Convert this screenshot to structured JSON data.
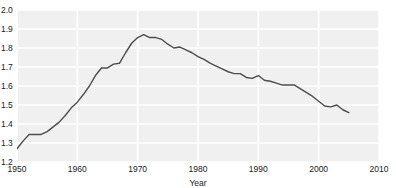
{
  "chart_data": {
    "type": "line",
    "title": "",
    "subtitle": "",
    "xlabel": "Year",
    "ylabel": "",
    "xlim": [
      1950,
      2010
    ],
    "ylim": [
      1.2,
      2.0
    ],
    "grid": true,
    "legend": false,
    "legend_position": "none",
    "line_color": "#4d4d4d",
    "plot_background": "#f0f0f0",
    "gridline_color": "#ffffff",
    "xticks": [
      "1950",
      "1960",
      "1970",
      "1980",
      "1990",
      "2000",
      "2010"
    ],
    "xtick_values": [
      1950,
      1960,
      1970,
      1980,
      1990,
      2000,
      2010
    ],
    "yticks": [
      "1.2",
      "1.3",
      "1.4",
      "1.5",
      "1.6",
      "1.7",
      "1.8",
      "1.9",
      "2.0"
    ],
    "ytick_values": [
      1.2,
      1.3,
      1.4,
      1.5,
      1.6,
      1.7,
      1.8,
      1.9,
      2.0
    ],
    "series": [
      {
        "name": "",
        "x": [
          1950,
          1951,
          1952,
          1953,
          1954,
          1955,
          1956,
          1957,
          1958,
          1959,
          1960,
          1961,
          1962,
          1963,
          1964,
          1965,
          1966,
          1967,
          1968,
          1969,
          1970,
          1971,
          1972,
          1973,
          1974,
          1975,
          1976,
          1977,
          1978,
          1979,
          1980,
          1981,
          1982,
          1983,
          1984,
          1985,
          1986,
          1987,
          1988,
          1989,
          1990,
          1991,
          1992,
          1993,
          1994,
          1995,
          1996,
          1997,
          1998,
          1999,
          2000,
          2001,
          2002,
          2003,
          2004,
          2005
        ],
        "values": [
          1.27,
          1.31,
          1.345,
          1.345,
          1.345,
          1.36,
          1.385,
          1.41,
          1.445,
          1.485,
          1.515,
          1.555,
          1.6,
          1.655,
          1.695,
          1.695,
          1.715,
          1.72,
          1.775,
          1.825,
          1.855,
          1.87,
          1.855,
          1.855,
          1.845,
          1.82,
          1.8,
          1.805,
          1.79,
          1.775,
          1.755,
          1.74,
          1.72,
          1.705,
          1.69,
          1.675,
          1.665,
          1.665,
          1.645,
          1.64,
          1.655,
          1.63,
          1.625,
          1.615,
          1.605,
          1.605,
          1.605,
          1.585,
          1.565,
          1.545,
          1.52,
          1.495,
          1.49,
          1.5,
          1.475,
          1.46
        ]
      }
    ]
  }
}
